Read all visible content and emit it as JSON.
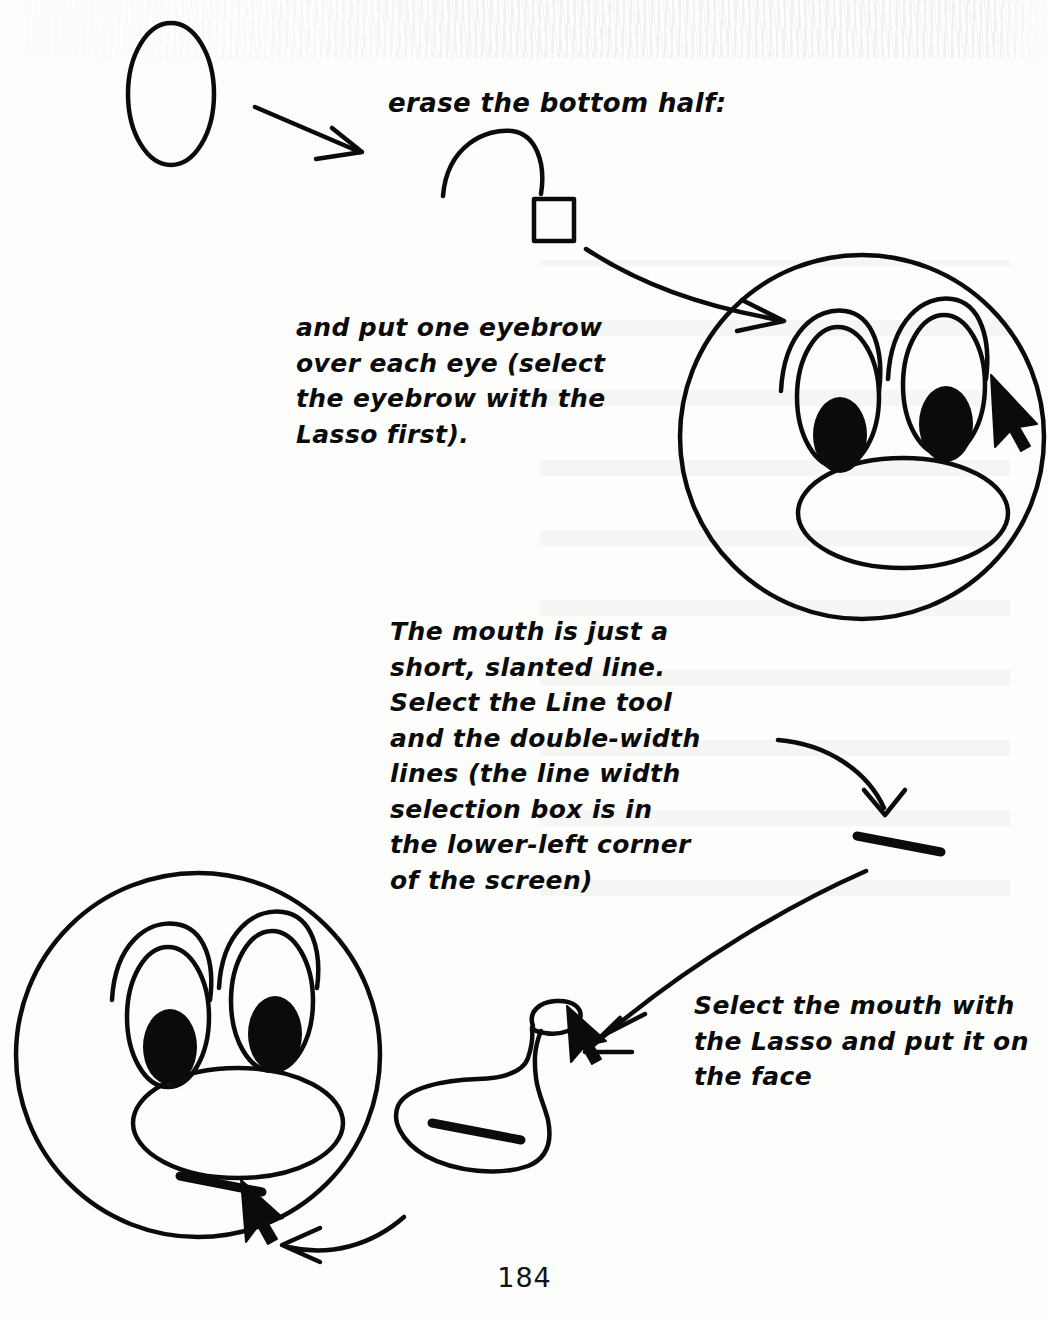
{
  "page": {
    "number": "184",
    "ink_color": "#0b0b0b",
    "paper_color": "#fdfdfc"
  },
  "annotations": {
    "erase_instruction": "erase the bottom half:",
    "eyebrow_instruction": "and put one eyebrow\nover each eye (select\nthe eyebrow with the\nLasso first).",
    "mouth_instruction": "The mouth is just a\nshort, slanted line.\nSelect the Line tool\nand the double-width\nlines (the line width\nselection box is in\nthe lower-left corner\nof the screen)",
    "lasso_instruction": "Select the mouth with\nthe Lasso and put it on\nthe face"
  },
  "figures": [
    {
      "id": "ellipse-shape",
      "label": "vertical ellipse outline"
    },
    {
      "id": "eyebrow-arc",
      "label": "half ellipse arc after erasing bottom half"
    },
    {
      "id": "selection-square",
      "label": "selection handle square"
    },
    {
      "id": "face-top",
      "label": "face with eyes, eyebrows and snout"
    },
    {
      "id": "mouth-line",
      "label": "short slanted double-width line"
    },
    {
      "id": "lasso-blob",
      "label": "lasso selection around the mouth line"
    },
    {
      "id": "face-bottom",
      "label": "finished face with mouth placed on it"
    }
  ],
  "cursors": [
    {
      "id": "cursor-eyebrow",
      "label": "arrow pointer on right eyebrow"
    },
    {
      "id": "cursor-lasso",
      "label": "arrow pointer on lasso knot"
    },
    {
      "id": "cursor-mouth",
      "label": "arrow pointer on placed mouth"
    }
  ],
  "arrows": [
    {
      "id": "arrow-ellipse-to-erase",
      "from": "ellipse-shape",
      "to": "erase_instruction"
    },
    {
      "id": "arrow-square-to-face",
      "from": "selection-square",
      "to": "face-top"
    },
    {
      "id": "arrow-text-to-mouthline",
      "from": "mouth_instruction",
      "to": "mouth-line"
    },
    {
      "id": "arrow-mouthline-to-lasso",
      "from": "mouth-line",
      "to": "lasso-blob"
    },
    {
      "id": "arrow-lasso-to-face",
      "from": "lasso-blob",
      "to": "face-bottom"
    }
  ]
}
